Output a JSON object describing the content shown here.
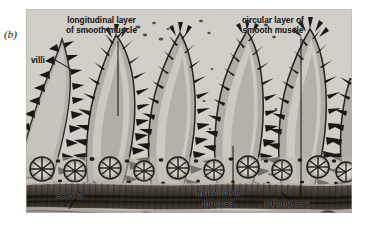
{
  "figure": {
    "panel_letter": "(b)",
    "background_color": "#ffffff"
  },
  "micrograph": {
    "tissue_background_color": "#c9c6c0",
    "stain_dark_color": "#14110e",
    "muscularis_band_color": "#3a332c",
    "lumen_color": "#d6d3cd",
    "frame": {
      "left": 26,
      "top": 9,
      "width": 326,
      "height": 204
    }
  },
  "labels": [
    {
      "id": "longitudinal",
      "name": "label-longitudinal-layer",
      "line1": "longitudinal layer",
      "line2": "of smooth muscle"
    },
    {
      "id": "circular",
      "name": "label-circular-layer",
      "line1": "circular layer of",
      "line2": "smooth muscle"
    },
    {
      "id": "villi",
      "name": "label-villi",
      "line1": "villi",
      "line2": ""
    },
    {
      "id": "serosa",
      "name": "label-serosa",
      "line1": "serosa",
      "line2": ""
    },
    {
      "id": "muscularis",
      "name": "label-muscularis-mucosa",
      "line1": "muscularis",
      "line2": "mucosa"
    },
    {
      "id": "submucosa",
      "name": "label-submucosa",
      "line1": "submucosa",
      "line2": ""
    }
  ],
  "leader_lines": [
    {
      "name": "leader-longitudinal",
      "x1": 118,
      "y1": 40,
      "x2": 118,
      "y2": 116
    },
    {
      "name": "leader-circular",
      "x1": 301,
      "y1": 38,
      "x2": 301,
      "y2": 196
    },
    {
      "name": "leader-villi",
      "x1": 56,
      "y1": 61,
      "x2": 70,
      "y2": 68
    },
    {
      "name": "leader-serosa",
      "x1": 80,
      "y1": 193,
      "x2": 70,
      "y2": 208
    },
    {
      "name": "leader-muscularis",
      "x1": 233,
      "y1": 146,
      "x2": 233,
      "y2": 196
    },
    {
      "name": "leader-submucosa",
      "x1": 291,
      "y1": 201,
      "x2": 283,
      "y2": 194
    }
  ]
}
